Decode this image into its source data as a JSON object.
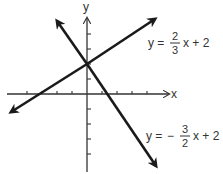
{
  "axes": {
    "x_label": "x",
    "y_label": "y",
    "x_ticks": [
      -5,
      -4,
      -3,
      -2,
      -1,
      1,
      2,
      3,
      4
    ],
    "y_ticks": [
      -4,
      -3,
      -2,
      -1,
      1,
      2,
      3,
      4
    ]
  },
  "lines": [
    {
      "name": "line-positive-slope",
      "equation_prefix": "y =",
      "sign": "",
      "numerator": "2",
      "denominator": "3",
      "suffix": "x + 2",
      "slope": 0.6667,
      "intercept": 2
    },
    {
      "name": "line-negative-slope",
      "equation_prefix": "y =",
      "sign": "−",
      "numerator": "3",
      "denominator": "2",
      "suffix": "x + 2",
      "slope": -1.5,
      "intercept": 2
    }
  ],
  "colors": {
    "line": "#1a1a1a",
    "axis": "#333333",
    "text": "#333333",
    "background": "#ffffff"
  }
}
